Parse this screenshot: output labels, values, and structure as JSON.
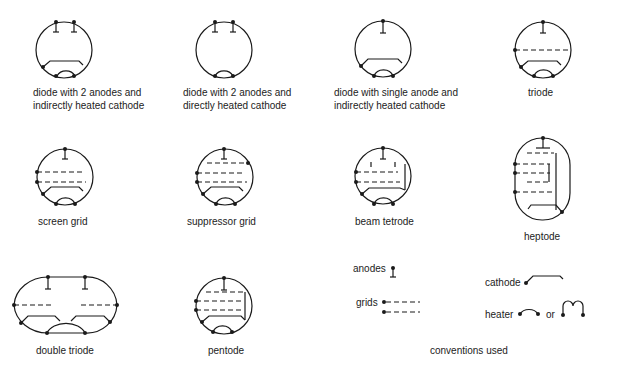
{
  "colors": {
    "ink": "#1a1a1a",
    "background": "#ffffff"
  },
  "symbols": [
    {
      "id": "diode-2a-ihc",
      "label_line1": "diode with 2 anodes and",
      "label_line2": "indirectly heated cathode"
    },
    {
      "id": "diode-2a-dhc",
      "label_line1": "diode with 2 anodes and",
      "label_line2": "directly heated cathode"
    },
    {
      "id": "diode-1a-ihc",
      "label_line1": "diode with single anode and",
      "label_line2": "indirectly heated cathode"
    },
    {
      "id": "triode",
      "label_line1": "triode"
    },
    {
      "id": "screen-grid",
      "label_line1": "screen grid"
    },
    {
      "id": "suppressor-grid",
      "label_line1": "suppressor grid"
    },
    {
      "id": "beam-tetrode",
      "label_line1": "beam tetrode"
    },
    {
      "id": "heptode",
      "label_line1": "heptode"
    },
    {
      "id": "double-triode",
      "label_line1": "double triode"
    },
    {
      "id": "pentode",
      "label_line1": "pentode"
    }
  ],
  "conventions": {
    "caption": "conventions used",
    "anodes": "anodes",
    "grids": "grids",
    "cathode": "cathode",
    "heater": "heater",
    "or": "or"
  }
}
